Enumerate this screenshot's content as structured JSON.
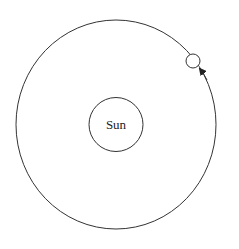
{
  "diagram": {
    "title": "",
    "sun": {
      "label": "Sun"
    },
    "orbit": {
      "direction": "counterclockwise"
    },
    "planet": {
      "label": ""
    },
    "colors": {
      "stroke": "#333333",
      "background": "#ffffff"
    }
  }
}
